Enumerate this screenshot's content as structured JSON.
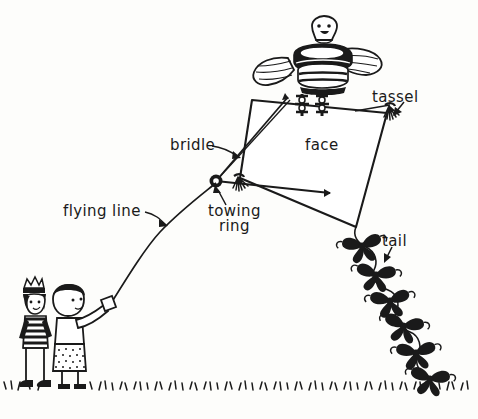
{
  "image": {
    "title": "Hand-drawn kite diagram",
    "background_color": "#fdfdfb",
    "ink_color": "#1a1a1a",
    "width": 478,
    "height": 419
  },
  "labels": {
    "bridle": "bridle",
    "towing_ring_line1": "towing",
    "towing_ring_line2": "ring",
    "flying_line": "flying line",
    "face": "face",
    "tassel": "tassel",
    "tail": "tail"
  },
  "parts": {
    "kite_sail": "kite-sail",
    "eagle_ornament": "eagle-ornament",
    "tassels": "tassels",
    "tail_bows": "tail-bows",
    "ground_grass": "ground-grass",
    "child_striped": "child-striped-shirt",
    "child_flyer": "child-holding-line"
  },
  "counts": {
    "tail_bows": 6,
    "children": 2,
    "tassels": 2
  }
}
